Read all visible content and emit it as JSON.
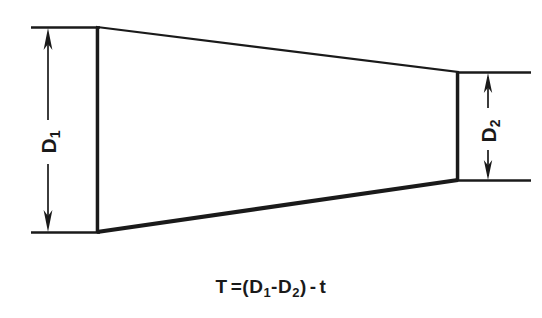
{
  "figure": {
    "type": "engineering-dimension-diagram",
    "background_color": "#ffffff",
    "line_color": "#1a1a1a"
  },
  "shape": {
    "name": "taper-outline",
    "kind": "trapezoid",
    "points": [
      {
        "x": 97,
        "y": 27
      },
      {
        "x": 458,
        "y": 72
      },
      {
        "x": 458,
        "y": 180
      },
      {
        "x": 97,
        "y": 232
      }
    ],
    "left_edge_length": 205,
    "right_edge_length": 108,
    "fill": "#ffffff",
    "stroke": "#1a1a1a"
  },
  "dimensions": [
    {
      "id": "d1",
      "label_base": "D",
      "label_subscript": "1",
      "position": "left",
      "line_x": 48,
      "top_y": 27,
      "bottom_y": 232,
      "extension_from_x": 32,
      "extension_to_x": 100,
      "arrowheads": "both",
      "rotation_deg": -90
    },
    {
      "id": "d2",
      "label_base": "D",
      "label_subscript": "2",
      "position": "right",
      "line_x": 488,
      "top_y": 72,
      "bottom_y": 180,
      "extension_from_x": 458,
      "extension_to_x": 530,
      "arrowheads": "both",
      "rotation_deg": -90
    }
  ],
  "formula": {
    "full_text": "T = (D1-D2) - t",
    "result_symbol": "T",
    "equals": "=",
    "open_paren": "(",
    "term1_base": "D",
    "term1_sub": "1",
    "minus1": "-",
    "term2_base": "D",
    "term2_sub": "2",
    "close_paren": ")",
    "minus2": "-",
    "term3": "t"
  }
}
